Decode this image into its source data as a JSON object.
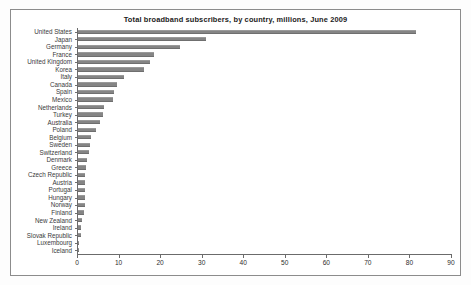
{
  "chart_data": {
    "type": "bar",
    "orientation": "horizontal",
    "title": "Total  broadband subscribers, by country, millions, June 2009",
    "xlabel": "",
    "ylabel": "",
    "xlim": [
      0,
      90
    ],
    "xticks": [
      0,
      10,
      20,
      30,
      40,
      50,
      60,
      70,
      80,
      90
    ],
    "grid": false,
    "legend": false,
    "bar_color": "#858585",
    "frame_color": "#8c8c8c",
    "categories": [
      "United States",
      "Japan",
      "Germany",
      "France",
      "United Kingdom",
      "Korea",
      "Italy",
      "Canada",
      "Spain",
      "Mexico",
      "Netherlands",
      "Turkey",
      "Australia",
      "Poland",
      "Belgium",
      "Sweden",
      "Switzerland",
      "Denmark",
      "Greece",
      "Czech Republic",
      "Austria",
      "Portugal",
      "Hungary",
      "Norway",
      "Finland",
      "New Zealand",
      "Ireland",
      "Slovak Republic",
      "Luxembourg",
      "Iceland"
    ],
    "values": [
      81.4,
      30.8,
      24.6,
      18.3,
      17.3,
      15.9,
      11.1,
      9.4,
      8.7,
      8.4,
      6.2,
      6.0,
      5.2,
      4.3,
      3.1,
      2.9,
      2.6,
      2.1,
      1.9,
      1.8,
      1.8,
      1.7,
      1.6,
      1.6,
      1.5,
      0.9,
      0.8,
      0.7,
      0.15,
      0.1
    ]
  }
}
